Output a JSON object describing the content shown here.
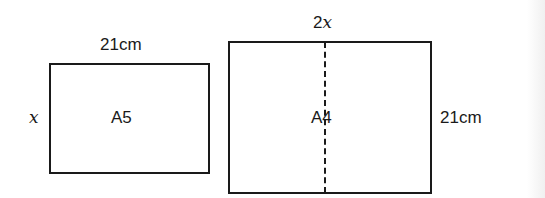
{
  "a5": {
    "name": "A5",
    "width_label": "21cm",
    "height_label": "x"
  },
  "a4": {
    "name": "A4",
    "width_label_coef": "2",
    "width_label_var": "x",
    "height_label": "21cm",
    "fold_line": "dashed center fold"
  }
}
